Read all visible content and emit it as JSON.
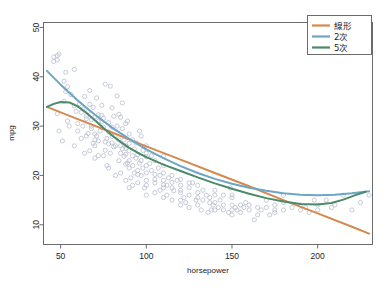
{
  "page": {
    "top_text_fragment": "",
    "bottom_text_fragment": ""
  },
  "chart_data": {
    "type": "scatter",
    "title": "",
    "xlabel": "horsepower",
    "ylabel": "mpg",
    "xlim": [
      40,
      232
    ],
    "ylim": [
      6,
      51
    ],
    "xticks": [
      50,
      100,
      150,
      200
    ],
    "yticks": [
      10,
      20,
      30,
      40,
      50
    ],
    "grid": false,
    "legend_position": "top-right",
    "point_style": {
      "marker": "open-circle",
      "color": "#b9bfd0",
      "radius": 2.1,
      "stroke_width": 0.8
    },
    "legend": [
      {
        "name": "線形",
        "color": "#d4894f"
      },
      {
        "name": "2次",
        "color": "#6ba6c6"
      },
      {
        "name": "5次",
        "color": "#4b8a69"
      }
    ],
    "series": [
      {
        "name": "線形",
        "kind": "line",
        "degree": 1,
        "color": "#d4894f",
        "points": [
          [
            42,
            33.9
          ],
          [
            60,
            31.4
          ],
          [
            80,
            28.7
          ],
          [
            100,
            25.9
          ],
          [
            120,
            23.2
          ],
          [
            140,
            20.5
          ],
          [
            160,
            17.8
          ],
          [
            180,
            15.0
          ],
          [
            200,
            12.3
          ],
          [
            220,
            9.6
          ],
          [
            230,
            8.2
          ]
        ]
      },
      {
        "name": "2次",
        "kind": "line",
        "degree": 2,
        "color": "#6ba6c6",
        "points": [
          [
            42,
            41.2
          ],
          [
            50,
            38.4
          ],
          [
            60,
            35.2
          ],
          [
            70,
            32.3
          ],
          [
            80,
            29.7
          ],
          [
            90,
            27.4
          ],
          [
            100,
            25.3
          ],
          [
            110,
            23.5
          ],
          [
            120,
            21.9
          ],
          [
            130,
            20.5
          ],
          [
            140,
            19.3
          ],
          [
            150,
            18.3
          ],
          [
            160,
            17.5
          ],
          [
            170,
            16.9
          ],
          [
            180,
            16.4
          ],
          [
            190,
            16.1
          ],
          [
            200,
            16.0
          ],
          [
            210,
            16.1
          ],
          [
            220,
            16.4
          ],
          [
            230,
            16.8
          ]
        ]
      },
      {
        "name": "5次",
        "kind": "line",
        "degree": 5,
        "color": "#4b8a69",
        "points": [
          [
            42,
            33.9
          ],
          [
            46,
            34.5
          ],
          [
            50,
            34.9
          ],
          [
            55,
            34.8
          ],
          [
            60,
            34.0
          ],
          [
            65,
            32.7
          ],
          [
            70,
            31.2
          ],
          [
            75,
            29.6
          ],
          [
            80,
            28.1
          ],
          [
            85,
            26.8
          ],
          [
            90,
            25.6
          ],
          [
            95,
            24.6
          ],
          [
            100,
            23.7
          ],
          [
            110,
            22.2
          ],
          [
            120,
            20.9
          ],
          [
            130,
            19.6
          ],
          [
            140,
            18.4
          ],
          [
            150,
            17.3
          ],
          [
            160,
            16.3
          ],
          [
            170,
            15.4
          ],
          [
            180,
            14.7
          ],
          [
            190,
            14.2
          ],
          [
            200,
            14.1
          ],
          [
            208,
            14.4
          ],
          [
            215,
            15.1
          ],
          [
            222,
            16.0
          ],
          [
            228,
            16.7
          ]
        ]
      }
    ],
    "scatter_points": [
      [
        46,
        43.1
      ],
      [
        46,
        44.0
      ],
      [
        48,
        43.4
      ],
      [
        48,
        44.3
      ],
      [
        49,
        44.6
      ],
      [
        52,
        39.1
      ],
      [
        52,
        35.0
      ],
      [
        53,
        40.9
      ],
      [
        53,
        37.0
      ],
      [
        54,
        38.0
      ],
      [
        58,
        41.5
      ],
      [
        58,
        34.1
      ],
      [
        60,
        30.5
      ],
      [
        60,
        29.0
      ],
      [
        62,
        32.8
      ],
      [
        63,
        33.5
      ],
      [
        64,
        36.0
      ],
      [
        65,
        31.5
      ],
      [
        65,
        32.0
      ],
      [
        65,
        28.0
      ],
      [
        66,
        33.0
      ],
      [
        67,
        37.2
      ],
      [
        67,
        34.4
      ],
      [
        68,
        30.0
      ],
      [
        68,
        29.5
      ],
      [
        68,
        31.3
      ],
      [
        69,
        33.8
      ],
      [
        70,
        31.9
      ],
      [
        70,
        26.0
      ],
      [
        70,
        27.2
      ],
      [
        70,
        28.4
      ],
      [
        71,
        28.0
      ],
      [
        72,
        32.3
      ],
      [
        72,
        31.0
      ],
      [
        72,
        27.0
      ],
      [
        74,
        34.2
      ],
      [
        74,
        32.2
      ],
      [
        74,
        30.9
      ],
      [
        75,
        31.6
      ],
      [
        75,
        29.8
      ],
      [
        75,
        24.0
      ],
      [
        76,
        26.8
      ],
      [
        76,
        25.1
      ],
      [
        77,
        27.5
      ],
      [
        78,
        30.7
      ],
      [
        78,
        28.8
      ],
      [
        78,
        26.4
      ],
      [
        79,
        38.1
      ],
      [
        80,
        33.7
      ],
      [
        80,
        29.8
      ],
      [
        80,
        27.9
      ],
      [
        80,
        26.6
      ],
      [
        81,
        25.8
      ],
      [
        82,
        28.1
      ],
      [
        82,
        26.0
      ],
      [
        83,
        36.1
      ],
      [
        83,
        30.0
      ],
      [
        84,
        32.4
      ],
      [
        84,
        27.2
      ],
      [
        85,
        31.8
      ],
      [
        85,
        26.0
      ],
      [
        85,
        24.5
      ],
      [
        86,
        29.5
      ],
      [
        86,
        25.4
      ],
      [
        87,
        27.2
      ],
      [
        87,
        23.9
      ],
      [
        88,
        26.0
      ],
      [
        88,
        24.3
      ],
      [
        88,
        22.3
      ],
      [
        88,
        25.5
      ],
      [
        88,
        30.5
      ],
      [
        89,
        22.5
      ],
      [
        90,
        28.4
      ],
      [
        90,
        26.5
      ],
      [
        90,
        25.0
      ],
      [
        90,
        23.0
      ],
      [
        90,
        21.5
      ],
      [
        92,
        27.2
      ],
      [
        92,
        24.0
      ],
      [
        92,
        22.0
      ],
      [
        93,
        25.4
      ],
      [
        94,
        26.6
      ],
      [
        94,
        23.5
      ],
      [
        95,
        24.2
      ],
      [
        95,
        21.0
      ],
      [
        95,
        20.2
      ],
      [
        96,
        22.5
      ],
      [
        97,
        23.0
      ],
      [
        97,
        20.0
      ],
      [
        97,
        28.0
      ],
      [
        98,
        25.1
      ],
      [
        98,
        21.5
      ],
      [
        100,
        24.5
      ],
      [
        100,
        22.0
      ],
      [
        100,
        20.5
      ],
      [
        100,
        19.0
      ],
      [
        100,
        23.8
      ],
      [
        100,
        18.0
      ],
      [
        100,
        26.0
      ],
      [
        102,
        22.4
      ],
      [
        103,
        21.0
      ],
      [
        105,
        20.2
      ],
      [
        105,
        18.5
      ],
      [
        105,
        23.0
      ],
      [
        105,
        19.2
      ],
      [
        107,
        21.5
      ],
      [
        108,
        20.0
      ],
      [
        110,
        20.5
      ],
      [
        110,
        18.1
      ],
      [
        110,
        17.5
      ],
      [
        110,
        22.0
      ],
      [
        110,
        19.0
      ],
      [
        110,
        23.9
      ],
      [
        112,
        18.0
      ],
      [
        113,
        19.5
      ],
      [
        115,
        17.5
      ],
      [
        115,
        18.6
      ],
      [
        115,
        20.0
      ],
      [
        116,
        16.9
      ],
      [
        120,
        18.0
      ],
      [
        120,
        16.5
      ],
      [
        120,
        15.0
      ],
      [
        120,
        19.2
      ],
      [
        120,
        17.0
      ],
      [
        122,
        15.5
      ],
      [
        125,
        17.5
      ],
      [
        125,
        16.0
      ],
      [
        125,
        18.5
      ],
      [
        129,
        15.0
      ],
      [
        130,
        14.0
      ],
      [
        130,
        16.5
      ],
      [
        130,
        18.0
      ],
      [
        130,
        15.5
      ],
      [
        132,
        13.0
      ],
      [
        133,
        15.0
      ],
      [
        135,
        16.0
      ],
      [
        137,
        14.5
      ],
      [
        137,
        15.5
      ],
      [
        138,
        13.0
      ],
      [
        139,
        14.0
      ],
      [
        140,
        16.0
      ],
      [
        140,
        14.5
      ],
      [
        140,
        13.0
      ],
      [
        140,
        17.0
      ],
      [
        142,
        13.5
      ],
      [
        145,
        13.0
      ],
      [
        145,
        14.0
      ],
      [
        145,
        16.0
      ],
      [
        148,
        12.5
      ],
      [
        150,
        14.0
      ],
      [
        150,
        15.5
      ],
      [
        150,
        13.0
      ],
      [
        150,
        16.0
      ],
      [
        150,
        12.0
      ],
      [
        152,
        13.5
      ],
      [
        153,
        13.0
      ],
      [
        155,
        14.0
      ],
      [
        155,
        12.5
      ],
      [
        158,
        14.5
      ],
      [
        160,
        13.0
      ],
      [
        160,
        14.0
      ],
      [
        165,
        13.5
      ],
      [
        165,
        12.0
      ],
      [
        167,
        13.0
      ],
      [
        170,
        15.0
      ],
      [
        170,
        13.5
      ],
      [
        175,
        14.0
      ],
      [
        175,
        13.0
      ],
      [
        175,
        12.5
      ],
      [
        180,
        16.0
      ],
      [
        180,
        13.0
      ],
      [
        180,
        14.5
      ],
      [
        190,
        13.0
      ],
      [
        190,
        14.0
      ],
      [
        193,
        13.5
      ],
      [
        198,
        15.0
      ],
      [
        200,
        14.0
      ],
      [
        200,
        13.0
      ],
      [
        208,
        13.5
      ],
      [
        210,
        14.0
      ],
      [
        215,
        16.0
      ],
      [
        220,
        13.0
      ],
      [
        225,
        14.5
      ],
      [
        230,
        16.0
      ],
      [
        49,
        29.0
      ],
      [
        51,
        27.0
      ],
      [
        54,
        31.0
      ],
      [
        56,
        36.4
      ],
      [
        59,
        33.0
      ],
      [
        61,
        34.5
      ],
      [
        63,
        30.0
      ],
      [
        66,
        28.5
      ],
      [
        69,
        26.5
      ],
      [
        71,
        35.7
      ],
      [
        73,
        29.0
      ],
      [
        76,
        38.5
      ],
      [
        79,
        24.5
      ],
      [
        81,
        32.0
      ],
      [
        84,
        23.0
      ],
      [
        86,
        34.7
      ],
      [
        89,
        31.0
      ],
      [
        91,
        19.5
      ],
      [
        93,
        20.5
      ],
      [
        96,
        29.0
      ],
      [
        99,
        17.5
      ],
      [
        103,
        24.0
      ],
      [
        108,
        17.0
      ],
      [
        112,
        16.0
      ],
      [
        118,
        19.0
      ],
      [
        123,
        14.5
      ],
      [
        127,
        18.5
      ],
      [
        133,
        17.0
      ],
      [
        136,
        12.5
      ],
      [
        143,
        15.0
      ],
      [
        149,
        17.5
      ],
      [
        157,
        13.5
      ],
      [
        163,
        11.0
      ],
      [
        172,
        12.0
      ],
      [
        185,
        13.5
      ],
      [
        195,
        12.5
      ],
      [
        205,
        15.0
      ],
      [
        48,
        32.5
      ],
      [
        55,
        30.0
      ],
      [
        62,
        27.5
      ],
      [
        70,
        23.5
      ],
      [
        77,
        22.0
      ],
      [
        85,
        20.5
      ],
      [
        95,
        18.5
      ],
      [
        105,
        16.5
      ],
      [
        115,
        15.0
      ],
      [
        125,
        13.5
      ],
      [
        88,
        19.0
      ],
      [
        90,
        17.5
      ],
      [
        92,
        18.0
      ],
      [
        100,
        16.0
      ],
      [
        110,
        15.5
      ],
      [
        120,
        14.0
      ],
      [
        67,
        25.0
      ],
      [
        72,
        24.0
      ],
      [
        78,
        21.5
      ],
      [
        82,
        20.0
      ],
      [
        58,
        26.0
      ],
      [
        64,
        24.5
      ]
    ]
  }
}
